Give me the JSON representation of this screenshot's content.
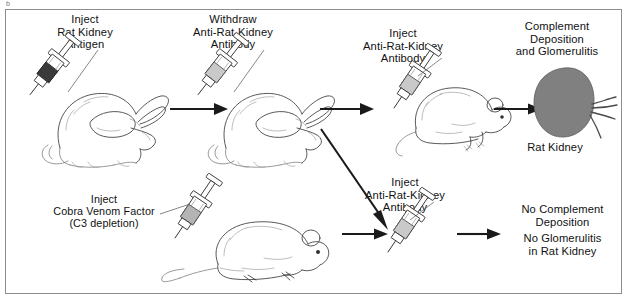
{
  "figure": {
    "domain_type": "diagram",
    "title_mark": "b",
    "width": 629,
    "height": 304,
    "background_color": "#ffffff",
    "border_color": "#8d8d8d"
  },
  "colors": {
    "ink": "#3b3b3b",
    "text": "#111111",
    "kidney_fill": "#808080",
    "syringe_antigen_fill": "#3a3a3a",
    "syringe_antibody_fill": "#c9c9c9",
    "syringe_cvf_fill": "#b4b4b4",
    "arrow": "#1a1a1a"
  },
  "labels": {
    "inject_rat_kidney_antigen": {
      "line1": "Inject",
      "line2": "Rat Kidney",
      "line3": "Antigen"
    },
    "withdraw_anti_rat_kidney_antibody": {
      "line1": "Withdraw",
      "line2": "Anti-Rat-Kidney",
      "line3": "Antibody"
    },
    "inject_anti_rat_kidney_antibody_top": {
      "line1": "Inject",
      "line2": "Anti-Rat-Kidney",
      "line3": "Antibody"
    },
    "inject_anti_rat_kidney_antibody_bottom": {
      "line1": "Inject",
      "line2": "Anti-Rat-Kidney",
      "line3": "Antibody"
    },
    "complement_outcome": {
      "line1": "Complement",
      "line2": "Deposition",
      "line3": "and Glomerulitis"
    },
    "rat_kidney_caption": "Rat Kidney",
    "inject_cobra_venom_factor": {
      "line1": "Inject",
      "line2": "Cobra Venom Factor",
      "line3": "(C3 depletion)"
    },
    "no_complement_outcome": {
      "line1": "No Complement",
      "line2": "Deposition"
    },
    "no_glomerulitis_outcome": {
      "line1": "No Glomerulitis",
      "line2": "in Rat Kidney"
    }
  },
  "icons": {
    "syringe_antigen": "syringe-icon",
    "syringe_withdraw": "syringe-icon",
    "syringe_inject_top": "syringe-icon",
    "syringe_inject_bottom": "syringe-icon",
    "syringe_cvf": "syringe-icon",
    "rabbit_1": "rabbit-icon",
    "rabbit_2": "rabbit-icon",
    "rat_top": "rat-icon",
    "rat_bottom": "rat-icon",
    "kidney": "kidney-icon",
    "arrow_1": "arrow-right-icon",
    "arrow_2": "arrow-right-icon",
    "arrow_3": "arrow-right-icon",
    "arrow_4": "arrow-right-icon",
    "arrow_diagonal": "arrow-down-right-icon"
  }
}
